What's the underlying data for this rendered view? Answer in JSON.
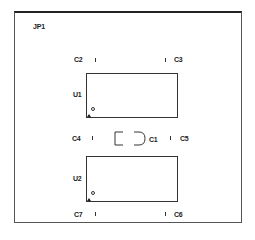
{
  "board": {
    "label": "JP1",
    "border_color": "#333333"
  },
  "components": {
    "c1": {
      "ref": "C1"
    },
    "c2": {
      "ref": "C2"
    },
    "c3": {
      "ref": "C3"
    },
    "c4": {
      "ref": "C4"
    },
    "c5": {
      "ref": "C5"
    },
    "c6": {
      "ref": "C6"
    },
    "c7": {
      "ref": "C7"
    },
    "u1": {
      "ref": "U1"
    },
    "u2": {
      "ref": "U2"
    }
  }
}
